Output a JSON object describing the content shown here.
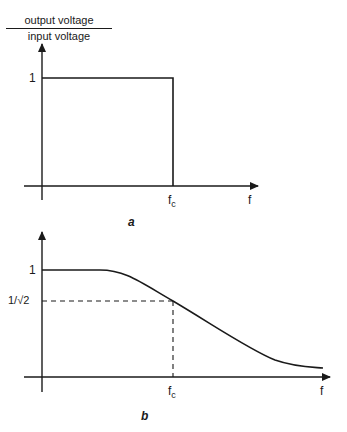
{
  "figure_a": {
    "caption": "a",
    "y_axis_label_numerator": "output voltage",
    "y_axis_label_denominator": "input voltage",
    "y_tick_1": "1",
    "x_tick_fc_main": "f",
    "x_tick_fc_sub": "c",
    "x_axis_label": "f",
    "description": "Ideal low-pass filter: gain 1 up to cutoff frequency fc, then 0"
  },
  "figure_b": {
    "caption": "b",
    "y_tick_1": "1",
    "y_tick_half_power": "1/√2",
    "x_tick_fc_main": "f",
    "x_tick_fc_sub": "c",
    "x_axis_label": "f",
    "description": "Practical low-pass filter response: gain rolls off smoothly, passing 1/√2 at fc"
  },
  "colors": {
    "ink": "#1a1a1a",
    "background": "#ffffff"
  }
}
